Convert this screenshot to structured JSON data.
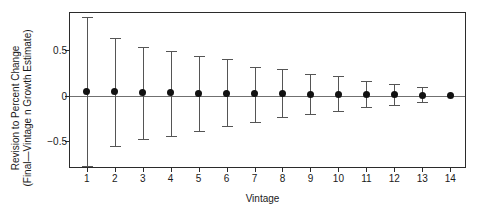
{
  "chart_data": {
    "type": "scatter",
    "title": "",
    "subtitle": "",
    "xlabel": "Vintage",
    "ylabel_line1": "Revision to Percent Change",
    "ylabel_line2": "(Final—Vintage n Growth Estimate)",
    "ylabel": "Revision to Percent Change (Final—Vintage n Growth Estimate)",
    "grid": false,
    "legend": "none",
    "xlim": [
      0.4,
      14.6
    ],
    "ylim": [
      -0.81,
      0.91
    ],
    "xticks": [
      1,
      2,
      3,
      4,
      5,
      6,
      7,
      8,
      9,
      10,
      11,
      12,
      13,
      14
    ],
    "xtick_labels": [
      "1",
      "2",
      "3",
      "4",
      "5",
      "6",
      "7",
      "8",
      "9",
      "10",
      "11",
      "12",
      "13",
      "14"
    ],
    "yticks": [
      -0.5,
      0,
      0.5
    ],
    "ytick_labels": [
      "−0.5",
      "0",
      "0.5"
    ],
    "zero_reference_line": 0,
    "categories": [
      "1",
      "2",
      "3",
      "4",
      "5",
      "6",
      "7",
      "8",
      "9",
      "10",
      "11",
      "12",
      "13",
      "14"
    ],
    "x": [
      1,
      2,
      3,
      4,
      5,
      6,
      7,
      8,
      9,
      10,
      11,
      12,
      13,
      14
    ],
    "values": [
      0.05,
      0.045,
      0.035,
      0.03,
      0.025,
      0.025,
      0.02,
      0.02,
      0.015,
      0.01,
      0.01,
      0.01,
      0.005,
      0.0
    ],
    "error_low": [
      -0.78,
      -0.56,
      -0.48,
      -0.45,
      -0.39,
      -0.34,
      -0.29,
      -0.24,
      -0.2,
      -0.17,
      -0.13,
      -0.1,
      -0.07,
      0.0
    ],
    "error_high": [
      0.87,
      0.63,
      0.53,
      0.49,
      0.44,
      0.4,
      0.31,
      0.29,
      0.24,
      0.21,
      0.16,
      0.13,
      0.09,
      0.0
    ],
    "series": [
      {
        "name": "Revision to percent change",
        "marker": "filled-circle",
        "errorbar": "vertical-capped",
        "values": [
          0.05,
          0.045,
          0.035,
          0.03,
          0.025,
          0.025,
          0.02,
          0.02,
          0.015,
          0.01,
          0.01,
          0.01,
          0.005,
          0.0
        ]
      }
    ],
    "colors": {
      "marker": "#111111",
      "errorbar": "#555555",
      "axis": "#2b2b2b",
      "zero_line": "#707070",
      "background": "#ffffff",
      "text": "#1a1a1a"
    }
  }
}
